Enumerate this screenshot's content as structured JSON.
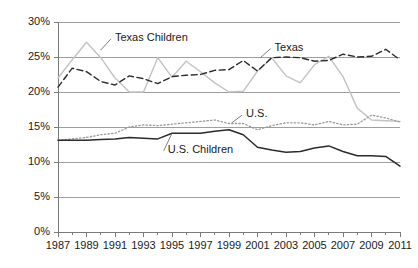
{
  "chart_data": {
    "type": "line",
    "title": "",
    "subtitle": "",
    "xlabel": "",
    "ylabel": "",
    "xlim": [
      1987,
      2011
    ],
    "ylim": [
      0,
      30
    ],
    "ytick_labels": [
      "0%",
      "5%",
      "10%",
      "15%",
      "20%",
      "25%",
      "30%"
    ],
    "ytick_values": [
      0,
      5,
      10,
      15,
      20,
      25,
      30
    ],
    "xtick_labels": [
      "1987",
      "1989",
      "1991",
      "1993",
      "1995",
      "1997",
      "1999",
      "2001",
      "2003",
      "2005",
      "2007",
      "2009",
      "2011"
    ],
    "xtick_values": [
      1987,
      1989,
      1991,
      1993,
      1995,
      1997,
      1999,
      2001,
      2003,
      2005,
      2007,
      2009,
      2011
    ],
    "grid": "horizontal",
    "legend_position": "inline-annotations",
    "x": [
      1987,
      1988,
      1989,
      1990,
      1991,
      1992,
      1993,
      1994,
      1995,
      1996,
      1997,
      1998,
      1999,
      2000,
      2001,
      2002,
      2003,
      2004,
      2005,
      2006,
      2007,
      2008,
      2009,
      2010,
      2011
    ],
    "series": [
      {
        "name": "Texas Children",
        "style": "solid",
        "color": "#c3c3c3",
        "width": 1.4,
        "label_x": 1991.0,
        "label_y": 27.6,
        "values": [
          22.0,
          24.6,
          27.1,
          24.9,
          22.0,
          20.0,
          20.0,
          24.9,
          22.1,
          24.4,
          22.9,
          21.3,
          20.0,
          20.1,
          23.0,
          24.9,
          22.3,
          21.3,
          23.9,
          25.1,
          22.2,
          17.7,
          16.0,
          15.9,
          15.8
        ]
      },
      {
        "name": "Texas",
        "style": "dashed",
        "color": "#2b2b2b",
        "width": 1.4,
        "label_x": 2002.2,
        "label_y": 26.2,
        "values": [
          20.7,
          23.4,
          22.9,
          21.5,
          21.0,
          22.3,
          21.9,
          21.2,
          22.2,
          22.4,
          22.5,
          23.1,
          23.2,
          24.5,
          23.0,
          24.9,
          25.0,
          24.9,
          24.4,
          24.5,
          25.4,
          25.0,
          25.1,
          26.1,
          24.6
        ]
      },
      {
        "name": "U.S.",
        "style": "dotted",
        "color": "#9a9a9a",
        "width": 1.3,
        "label_x": 2000.2,
        "label_y": 16.7,
        "values": [
          13.1,
          13.3,
          13.5,
          13.9,
          14.1,
          15.0,
          15.3,
          15.2,
          15.4,
          15.6,
          15.8,
          16.0,
          15.5,
          15.5,
          14.6,
          15.2,
          15.6,
          15.6,
          15.3,
          15.8,
          15.3,
          15.4,
          16.7,
          16.3,
          15.7
        ]
      },
      {
        "name": "U.S. Children",
        "style": "solid",
        "color": "#2b2b2b",
        "width": 1.5,
        "label_x": 1994.7,
        "label_y": 11.6,
        "values": [
          13.1,
          13.1,
          13.1,
          13.2,
          13.3,
          13.5,
          13.4,
          13.3,
          14.1,
          14.1,
          14.1,
          14.4,
          14.6,
          13.9,
          12.1,
          11.7,
          11.4,
          11.5,
          12.0,
          12.3,
          11.5,
          10.9,
          10.9,
          10.8,
          9.4
        ]
      }
    ],
    "annotations": [
      {
        "name": "Texas Children",
        "leader_from_x": 1990.0,
        "leader_from_y": 26.0
      },
      {
        "name": "Texas",
        "leader_from_x": 2001.2,
        "leader_from_y": 24.9
      },
      {
        "name": "U.S.",
        "leader_from_x": 1999.2,
        "leader_from_y": 15.6
      },
      {
        "name": "U.S. Children",
        "leader_from_x": 1995.0,
        "leader_from_y": 14.1
      }
    ],
    "axis_color": "#7a7a7a",
    "grid_color": "#9e9e9e",
    "text_color": "#1a1a1a",
    "background": "#ffffff"
  }
}
